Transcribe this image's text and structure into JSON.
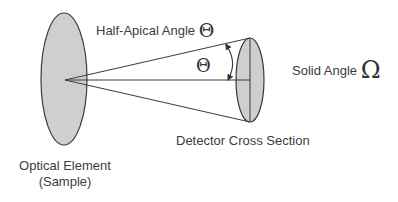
{
  "diagram": {
    "type": "solid-angle-geometry",
    "labels": {
      "half_apical_angle_text": "Half-Apical Angle",
      "half_apical_angle_symbol": "Θ",
      "inner_angle_symbol": "Θ",
      "solid_angle_text": "Solid Angle",
      "solid_angle_symbol": "Ω",
      "detector": "Detector Cross Section",
      "optical_element_line1": "Optical Element",
      "optical_element_line2": "(Sample)"
    },
    "colors": {
      "fill": "#cfcfcf",
      "stroke": "#3a3a3a",
      "text": "#3c3c3c",
      "background": "#ffffff"
    },
    "shapes": {
      "optical_element": {
        "cx": 64,
        "cy": 79,
        "rx": 23,
        "ry": 66
      },
      "detector": {
        "cx": 250,
        "cy": 80,
        "rx": 14,
        "ry": 42
      },
      "apex": {
        "x": 65,
        "y": 80
      }
    }
  }
}
